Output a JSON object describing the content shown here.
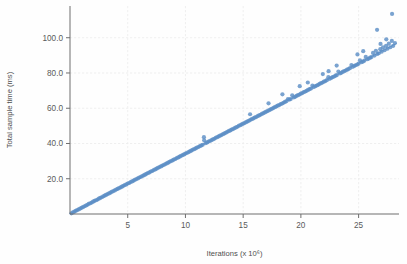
{
  "chart_data": {
    "type": "scatter",
    "title": "",
    "xlabel": "Iterations (x 10^6)",
    "ylabel": "Total sample time (ms)",
    "xlim": [
      0,
      28.5
    ],
    "ylim": [
      0,
      118
    ],
    "xticks": [
      5,
      10,
      15,
      20,
      25
    ],
    "xtick_labels": [
      "5",
      "10",
      "15",
      "20",
      "25"
    ],
    "yticks": [
      20,
      40,
      60,
      80,
      100
    ],
    "ytick_labels": [
      "20.0",
      "40.0",
      "60.0",
      "80.0",
      "100.0"
    ],
    "grid": true,
    "legend": null,
    "marker_color": "#5d8fc6",
    "trendline_color": "#6d9ccd",
    "trendline": {
      "slope": 3.42,
      "intercept": 0.0,
      "x_start": 0.0,
      "x_end": 28.3
    },
    "annotations": [],
    "points": [
      [
        0.12,
        0.4
      ],
      [
        0.25,
        0.9
      ],
      [
        0.38,
        1.3
      ],
      [
        0.5,
        1.8
      ],
      [
        0.62,
        2.2
      ],
      [
        0.75,
        2.6
      ],
      [
        0.88,
        3.1
      ],
      [
        1.0,
        3.5
      ],
      [
        1.12,
        3.9
      ],
      [
        1.25,
        4.4
      ],
      [
        1.38,
        4.8
      ],
      [
        1.5,
        5.2
      ],
      [
        1.62,
        5.7
      ],
      [
        1.75,
        6.1
      ],
      [
        1.88,
        6.5
      ],
      [
        2.0,
        7.0
      ],
      [
        2.12,
        7.4
      ],
      [
        2.25,
        7.8
      ],
      [
        2.38,
        8.2
      ],
      [
        2.5,
        8.7
      ],
      [
        2.62,
        9.1
      ],
      [
        2.75,
        9.5
      ],
      [
        2.88,
        10.0
      ],
      [
        3.0,
        10.4
      ],
      [
        3.12,
        10.8
      ],
      [
        3.25,
        11.3
      ],
      [
        3.38,
        11.7
      ],
      [
        3.5,
        12.1
      ],
      [
        3.62,
        12.6
      ],
      [
        3.75,
        13.0
      ],
      [
        3.88,
        13.4
      ],
      [
        4.0,
        13.9
      ],
      [
        4.12,
        14.2
      ],
      [
        4.25,
        14.7
      ],
      [
        4.38,
        15.1
      ],
      [
        4.5,
        15.5
      ],
      [
        4.62,
        16.0
      ],
      [
        4.75,
        16.4
      ],
      [
        4.88,
        16.8
      ],
      [
        5.0,
        17.3
      ],
      [
        5.12,
        17.6
      ],
      [
        5.25,
        18.1
      ],
      [
        5.38,
        18.5
      ],
      [
        5.5,
        18.9
      ],
      [
        5.62,
        19.4
      ],
      [
        5.75,
        19.8
      ],
      [
        5.88,
        20.2
      ],
      [
        6.0,
        20.7
      ],
      [
        6.12,
        21.0
      ],
      [
        6.25,
        21.5
      ],
      [
        6.38,
        21.9
      ],
      [
        6.5,
        22.3
      ],
      [
        6.62,
        22.8
      ],
      [
        6.75,
        23.2
      ],
      [
        6.88,
        23.6
      ],
      [
        7.0,
        24.1
      ],
      [
        7.12,
        24.4
      ],
      [
        7.25,
        24.9
      ],
      [
        7.38,
        25.3
      ],
      [
        7.5,
        25.7
      ],
      [
        7.62,
        26.2
      ],
      [
        7.75,
        26.6
      ],
      [
        7.88,
        27.0
      ],
      [
        8.0,
        27.5
      ],
      [
        8.12,
        27.8
      ],
      [
        8.25,
        28.3
      ],
      [
        8.38,
        28.7
      ],
      [
        8.5,
        29.1
      ],
      [
        8.62,
        29.6
      ],
      [
        8.75,
        30.0
      ],
      [
        8.88,
        30.4
      ],
      [
        9.0,
        30.9
      ],
      [
        9.12,
        31.2
      ],
      [
        9.25,
        31.7
      ],
      [
        9.38,
        32.1
      ],
      [
        9.5,
        32.5
      ],
      [
        9.62,
        33.0
      ],
      [
        9.75,
        33.4
      ],
      [
        9.88,
        33.8
      ],
      [
        10.0,
        34.3
      ],
      [
        10.12,
        34.6
      ],
      [
        10.25,
        35.1
      ],
      [
        10.38,
        35.5
      ],
      [
        10.5,
        35.9
      ],
      [
        10.62,
        36.4
      ],
      [
        10.75,
        36.8
      ],
      [
        10.88,
        37.2
      ],
      [
        11.0,
        37.7
      ],
      [
        11.12,
        38.0
      ],
      [
        11.25,
        38.5
      ],
      [
        11.38,
        38.9
      ],
      [
        11.5,
        39.3
      ],
      [
        11.62,
        41.8
      ],
      [
        11.75,
        40.2
      ],
      [
        11.88,
        40.6
      ],
      [
        12.0,
        41.1
      ],
      [
        12.12,
        41.4
      ],
      [
        12.25,
        41.9
      ],
      [
        12.38,
        42.3
      ],
      [
        12.5,
        42.7
      ],
      [
        12.62,
        43.2
      ],
      [
        12.75,
        43.6
      ],
      [
        12.88,
        44.0
      ],
      [
        13.0,
        44.5
      ],
      [
        13.12,
        44.8
      ],
      [
        13.25,
        45.3
      ],
      [
        13.38,
        45.7
      ],
      [
        13.5,
        46.1
      ],
      [
        13.62,
        46.6
      ],
      [
        13.75,
        47.0
      ],
      [
        13.88,
        47.4
      ],
      [
        14.0,
        47.9
      ],
      [
        14.12,
        48.2
      ],
      [
        14.25,
        48.7
      ],
      [
        14.38,
        49.1
      ],
      [
        14.5,
        49.5
      ],
      [
        14.62,
        50.0
      ],
      [
        14.75,
        50.4
      ],
      [
        14.88,
        50.8
      ],
      [
        15.0,
        51.3
      ],
      [
        15.12,
        51.6
      ],
      [
        15.25,
        52.1
      ],
      [
        15.38,
        52.5
      ],
      [
        15.5,
        52.9
      ],
      [
        15.62,
        53.4
      ],
      [
        15.75,
        53.8
      ],
      [
        15.88,
        54.2
      ],
      [
        16.0,
        54.7
      ],
      [
        16.12,
        55.0
      ],
      [
        16.25,
        55.5
      ],
      [
        16.38,
        55.9
      ],
      [
        16.5,
        56.3
      ],
      [
        16.62,
        56.8
      ],
      [
        16.75,
        57.2
      ],
      [
        16.88,
        57.6
      ],
      [
        17.0,
        58.1
      ],
      [
        17.12,
        58.4
      ],
      [
        17.25,
        58.9
      ],
      [
        17.38,
        59.3
      ],
      [
        17.5,
        59.7
      ],
      [
        17.62,
        60.2
      ],
      [
        17.75,
        60.6
      ],
      [
        17.88,
        61.0
      ],
      [
        18.0,
        61.5
      ],
      [
        18.12,
        61.8
      ],
      [
        18.25,
        62.3
      ],
      [
        18.38,
        62.7
      ],
      [
        18.5,
        63.1
      ],
      [
        18.62,
        63.6
      ],
      [
        18.75,
        64.0
      ],
      [
        18.88,
        65.2
      ],
      [
        19.0,
        64.9
      ],
      [
        19.12,
        65.2
      ],
      [
        19.25,
        67.3
      ],
      [
        19.38,
        66.1
      ],
      [
        19.5,
        66.5
      ],
      [
        19.62,
        67.0
      ],
      [
        19.75,
        67.4
      ],
      [
        19.88,
        67.8
      ],
      [
        20.0,
        68.3
      ],
      [
        20.12,
        68.6
      ],
      [
        20.25,
        69.1
      ],
      [
        20.38,
        69.5
      ],
      [
        20.5,
        69.9
      ],
      [
        20.62,
        70.4
      ],
      [
        20.75,
        70.8
      ],
      [
        20.88,
        71.2
      ],
      [
        21.0,
        72.9
      ],
      [
        21.12,
        72.0
      ],
      [
        21.25,
        72.5
      ],
      [
        21.38,
        72.9
      ],
      [
        21.5,
        73.3
      ],
      [
        21.62,
        73.8
      ],
      [
        21.75,
        74.2
      ],
      [
        21.88,
        74.6
      ],
      [
        22.0,
        75.1
      ],
      [
        22.12,
        75.4
      ],
      [
        22.25,
        75.9
      ],
      [
        22.38,
        77.6
      ],
      [
        22.5,
        76.7
      ],
      [
        22.62,
        77.2
      ],
      [
        22.75,
        77.6
      ],
      [
        22.88,
        78.0
      ],
      [
        23.0,
        78.5
      ],
      [
        23.12,
        78.8
      ],
      [
        23.25,
        80.8
      ],
      [
        23.38,
        79.7
      ],
      [
        23.5,
        80.1
      ],
      [
        23.62,
        80.6
      ],
      [
        23.75,
        81.0
      ],
      [
        23.88,
        81.4
      ],
      [
        24.0,
        81.9
      ],
      [
        24.12,
        82.2
      ],
      [
        24.25,
        82.7
      ],
      [
        24.38,
        84.5
      ],
      [
        24.5,
        83.5
      ],
      [
        24.62,
        84.0
      ],
      [
        24.75,
        84.4
      ],
      [
        24.88,
        84.8
      ],
      [
        25.0,
        85.3
      ],
      [
        25.12,
        87.2
      ],
      [
        25.25,
        86.1
      ],
      [
        25.38,
        86.5
      ],
      [
        25.5,
        87.0
      ],
      [
        25.62,
        89.1
      ],
      [
        25.75,
        87.8
      ],
      [
        25.88,
        88.2
      ],
      [
        26.0,
        88.7
      ],
      [
        26.12,
        89.0
      ],
      [
        26.25,
        91.4
      ],
      [
        26.38,
        89.9
      ],
      [
        26.5,
        92.6
      ],
      [
        26.62,
        90.8
      ],
      [
        26.75,
        91.2
      ],
      [
        26.88,
        93.5
      ],
      [
        27.0,
        92.1
      ],
      [
        27.12,
        94.6
      ],
      [
        27.25,
        92.9
      ],
      [
        27.38,
        95.4
      ],
      [
        27.5,
        93.8
      ],
      [
        27.62,
        96.6
      ],
      [
        27.75,
        94.6
      ],
      [
        27.88,
        98.2
      ],
      [
        28.0,
        95.4
      ],
      [
        28.15,
        97.0
      ],
      [
        26.6,
        104.5
      ],
      [
        27.9,
        113.5
      ],
      [
        24.9,
        90.5
      ],
      [
        23.1,
        84.2
      ],
      [
        21.9,
        79.4
      ],
      [
        19.9,
        72.5
      ],
      [
        18.4,
        67.9
      ],
      [
        17.2,
        62.8
      ],
      [
        15.6,
        56.6
      ],
      [
        11.6,
        43.6
      ],
      [
        20.6,
        74.6
      ],
      [
        22.4,
        81.0
      ],
      [
        25.4,
        92.4
      ],
      [
        26.9,
        96.5
      ],
      [
        27.4,
        99.1
      ]
    ]
  },
  "axis": {
    "y_title": "Total sample time (ms)",
    "x_title": "Iterations (x 10^6)"
  }
}
